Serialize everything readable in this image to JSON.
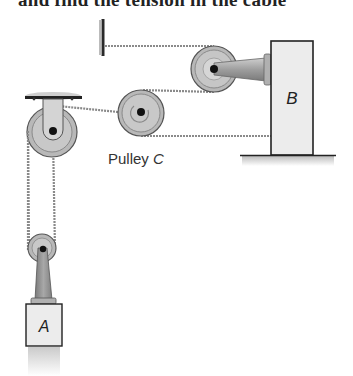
{
  "caption": {
    "text": "and find the tension in the cable"
  },
  "labels": {
    "block_a": "A",
    "block_b": "B",
    "pulley_c": "Pulley C",
    "pulley_c_italic": "C",
    "pulley_c_prefix": "Pulley "
  },
  "colors": {
    "rope": "#8a8a8a",
    "pulley_outer": "#b5b5b5",
    "pulley_inner": "#cfcfcf",
    "hub": "#111111",
    "block_fill": "#e8e8e8",
    "block_stroke": "#222222",
    "strut": "#9a9a9a"
  }
}
